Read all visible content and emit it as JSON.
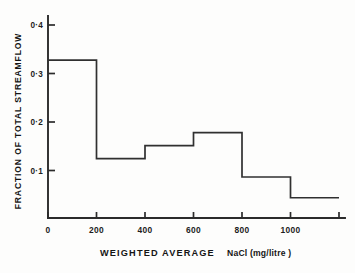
{
  "chart_data": {
    "type": "bar",
    "title": "",
    "xlabel": "WEIGHTED AVERAGE NaCl (mg/litre)",
    "xlabel_main": "WEIGHTED   AVERAGE",
    "xlabel_unit": "NaCl (mg/litre )",
    "ylabel": "FRACTION OF TOTAL STREAMFLOW",
    "grid": false,
    "legend": false,
    "xlim": [
      0,
      1200
    ],
    "ylim": [
      0,
      0.43
    ],
    "xticks": [
      0,
      200,
      400,
      600,
      800,
      1000,
      1200
    ],
    "xtick_labels": [
      "0",
      "200",
      "400",
      "600",
      "800",
      "1000",
      ""
    ],
    "yticks": [
      0.1,
      0.2,
      0.3,
      0.4
    ],
    "ytick_labels": [
      "0·1",
      "0·2",
      "0·3",
      "0·4"
    ],
    "bin_edges": [
      0,
      200,
      400,
      600,
      800,
      1000,
      1200
    ],
    "categories": [
      "0-200",
      "200-400",
      "400-600",
      "600-800",
      "800-1000",
      "1000-1200"
    ],
    "values": [
      0.327,
      0.123,
      0.15,
      0.177,
      0.085,
      0.042
    ]
  }
}
